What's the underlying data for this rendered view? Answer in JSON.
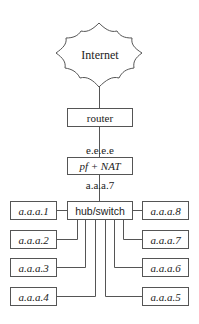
{
  "diagram": {
    "cloud": {
      "label": "Internet"
    },
    "router": {
      "label": "router"
    },
    "firewall": {
      "label": "pf + NAT",
      "external_ip": "e.e.e.e",
      "internal_ip": "a.a.a.7"
    },
    "hub": {
      "label": "hub/switch"
    },
    "hosts_left": [
      "a.a.a.1",
      "a.a.a.2",
      "a.a.a.3",
      "a.a.a.4"
    ],
    "hosts_right": [
      "a.a.a.8",
      "a.a.a.7",
      "a.a.a.6",
      "a.a.a.5"
    ],
    "colors": {
      "line": "#555555",
      "text": "#222222",
      "background": "#ffffff"
    }
  }
}
